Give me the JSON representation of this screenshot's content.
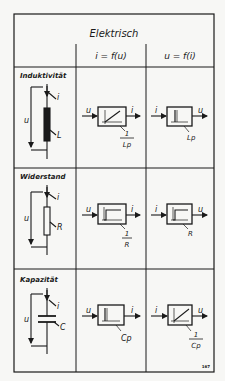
{
  "header": {
    "title": "Elektrisch",
    "col1": "i = f(u)",
    "col2": "u = f(i)"
  },
  "rows": [
    {
      "name": "Induktivität",
      "element_label": "L",
      "current_label": "i",
      "voltage_label": "u",
      "block1": {
        "input": "u",
        "output": "i",
        "gain_num": "1",
        "gain_den": "Lp",
        "response": "ramp"
      },
      "block2": {
        "input": "i",
        "output": "u",
        "gain": "Lp",
        "response": "impulse"
      }
    },
    {
      "name": "Widerstand",
      "element_label": "R",
      "current_label": "i",
      "voltage_label": "u",
      "block1": {
        "input": "u",
        "output": "i",
        "gain_num": "1",
        "gain_den": "R",
        "response": "step"
      },
      "block2": {
        "input": "i",
        "output": "u",
        "gain": "R",
        "response": "step"
      }
    },
    {
      "name": "Kapazität",
      "element_label": "C",
      "current_label": "i",
      "voltage_label": "u",
      "block1": {
        "input": "u",
        "output": "i",
        "gain": "Cp",
        "response": "impulse"
      },
      "block2": {
        "input": "i",
        "output": "u",
        "gain_num": "1",
        "gain_den": "Cp",
        "response": "ramp"
      }
    }
  ],
  "figure_number": "167"
}
